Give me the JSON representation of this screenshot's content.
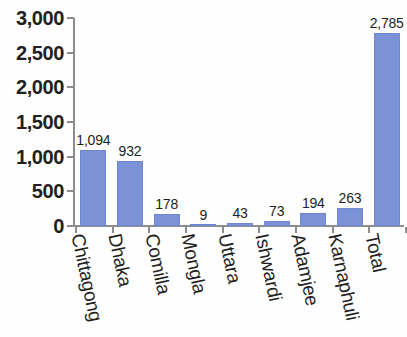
{
  "chart_data": {
    "type": "bar",
    "title": "",
    "subtitle": "",
    "xlabel": "",
    "ylabel": "",
    "categories": [
      "Chittagong",
      "Dhaka",
      "Comilla",
      "Mongla",
      "Uttara",
      "Ishwardi",
      "Adamjee",
      "Karnaphuli",
      "Total"
    ],
    "values": [
      1094,
      932,
      178,
      9,
      43,
      73,
      194,
      263,
      2785
    ],
    "value_labels": [
      "1,094",
      "932",
      "178",
      "9",
      "43",
      "73",
      "194",
      "263",
      "2,785"
    ],
    "ylim": [
      0,
      3000
    ],
    "ytick_values": [
      3000,
      2500,
      2000,
      1500,
      1000,
      500,
      0
    ],
    "ytick_labels": [
      "3,000",
      "2,500",
      "2,000",
      "1,500",
      "1,000",
      "500",
      "0"
    ],
    "grid": false,
    "legend": null,
    "legend_position": "none",
    "series": [
      {
        "name": "",
        "values": [
          1094,
          932,
          178,
          9,
          43,
          73,
          194,
          263,
          2785
        ]
      }
    ],
    "colors": {
      "bar": "#7b93d6",
      "bar_border": "#6f88cf",
      "axis": "#8d8d8d",
      "text": "#231f20",
      "background": "#fefefe"
    }
  }
}
